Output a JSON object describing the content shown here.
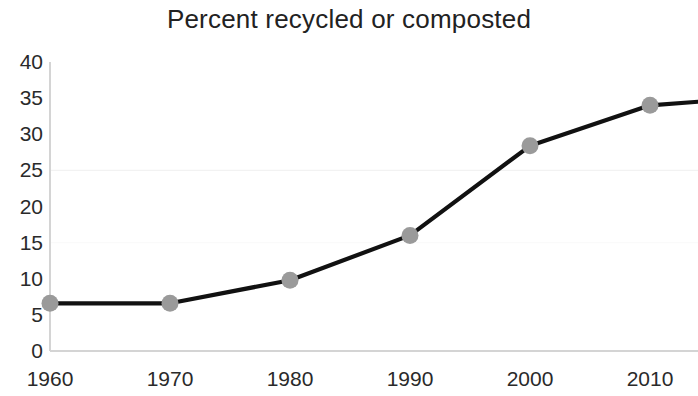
{
  "chart_data": {
    "type": "line",
    "title": "Percent recycled or composted",
    "xlabel": "",
    "ylabel": "",
    "x": [
      1960,
      1970,
      1980,
      1990,
      2000,
      2010
    ],
    "categories": [
      "1960",
      "1970",
      "1980",
      "1990",
      "2000",
      "2010"
    ],
    "values": [
      6.6,
      6.6,
      9.8,
      16.0,
      28.4,
      34.0
    ],
    "series": [
      {
        "name": "Percent recycled or composted",
        "values": [
          6.6,
          6.6,
          9.8,
          16.0,
          28.4,
          34.0
        ]
      }
    ],
    "xlim": [
      1960,
      2014
    ],
    "ylim": [
      0,
      40
    ],
    "yticks": [
      0,
      5,
      10,
      15,
      20,
      25,
      30,
      35,
      40
    ],
    "ytick_labels": [
      "0",
      "5",
      "10",
      "15",
      "20",
      "25",
      "30",
      "35",
      "40"
    ],
    "xticks": [
      1960,
      1970,
      1980,
      1990,
      2000,
      2010
    ],
    "xtick_labels": [
      "1960",
      "1970",
      "1980",
      "1990",
      "2000",
      "2010"
    ],
    "grid": "faint-horizontal",
    "legend": "none",
    "line_color": "#111111",
    "marker_color": "#9a9a9a",
    "marker_shape": "circle",
    "axis_color": "#d0d0d0",
    "background_color": "#ffffff",
    "line_extends_past_last_point_to": 34.5
  },
  "axis": {
    "y_labels": [
      "40",
      "35",
      "30",
      "25",
      "20",
      "15",
      "10",
      "5",
      "0"
    ],
    "x_labels": [
      "1960",
      "1970",
      "1980",
      "1990",
      "2000",
      "2010"
    ]
  }
}
